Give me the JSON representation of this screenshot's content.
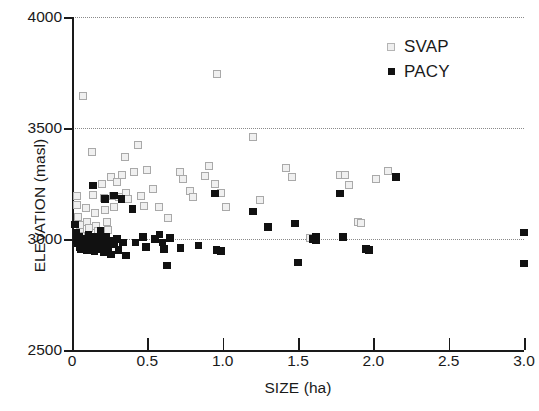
{
  "chart_data": {
    "type": "scatter",
    "title": "",
    "xlabel": "SIZE (ha)",
    "ylabel": "ELEVATION (masl)",
    "xlim": [
      0,
      3.0
    ],
    "ylim": [
      2500,
      4000
    ],
    "xticks": [
      "0",
      "0.5",
      "1.0",
      "1.5",
      "2.0",
      "2.5",
      "3.0"
    ],
    "xtick_values": [
      0,
      0.5,
      1.0,
      1.5,
      2.0,
      2.5,
      3.0
    ],
    "yticks": [
      "2500",
      "3000",
      "3500",
      "4000"
    ],
    "ytick_values": [
      2500,
      3000,
      3500,
      4000
    ],
    "grid": "horizontal-dotted",
    "gridline_values": [
      3000,
      3500,
      4000
    ],
    "legend_position": "top-right",
    "legend": [
      {
        "label": "SVAP",
        "marker": "open-square",
        "color": "#a9a9a9",
        "fill": "#f0f0f0"
      },
      {
        "label": "PACY",
        "marker": "filled-square",
        "color": "#111111",
        "fill": "#111111"
      }
    ],
    "series": [
      {
        "name": "SVAP",
        "marker": "open-square",
        "color": "#a9a9a9",
        "points": [
          [
            0.07,
            3645
          ],
          [
            0.96,
            3745
          ],
          [
            0.03,
            3195
          ],
          [
            0.03,
            3155
          ],
          [
            0.04,
            3100
          ],
          [
            0.05,
            3065
          ],
          [
            0.05,
            3030
          ],
          [
            0.06,
            3015
          ],
          [
            0.07,
            2995
          ],
          [
            0.09,
            3140
          ],
          [
            0.1,
            3075
          ],
          [
            0.11,
            3050
          ],
          [
            0.12,
            3010
          ],
          [
            0.13,
            3390
          ],
          [
            0.14,
            3200
          ],
          [
            0.15,
            3115
          ],
          [
            0.16,
            3060
          ],
          [
            0.17,
            3035
          ],
          [
            0.18,
            3005
          ],
          [
            0.2,
            3250
          ],
          [
            0.21,
            3185
          ],
          [
            0.22,
            3130
          ],
          [
            0.23,
            3075
          ],
          [
            0.24,
            3040
          ],
          [
            0.26,
            3280
          ],
          [
            0.27,
            3195
          ],
          [
            0.28,
            3145
          ],
          [
            0.3,
            3255
          ],
          [
            0.31,
            3190
          ],
          [
            0.33,
            3290
          ],
          [
            0.35,
            3370
          ],
          [
            0.36,
            3205
          ],
          [
            0.37,
            3180
          ],
          [
            0.41,
            3300
          ],
          [
            0.44,
            3425
          ],
          [
            0.46,
            3195
          ],
          [
            0.48,
            3150
          ],
          [
            0.5,
            3310
          ],
          [
            0.54,
            3225
          ],
          [
            0.58,
            3145
          ],
          [
            0.64,
            3095
          ],
          [
            0.72,
            3300
          ],
          [
            0.74,
            3270
          ],
          [
            0.78,
            3215
          ],
          [
            0.8,
            3190
          ],
          [
            0.88,
            3285
          ],
          [
            0.91,
            3330
          ],
          [
            0.95,
            3250
          ],
          [
            0.99,
            3205
          ],
          [
            1.02,
            3145
          ],
          [
            1.2,
            3460
          ],
          [
            1.25,
            3175
          ],
          [
            1.42,
            3320
          ],
          [
            1.46,
            3280
          ],
          [
            1.58,
            3005
          ],
          [
            1.78,
            3290
          ],
          [
            1.81,
            3290
          ],
          [
            1.84,
            3245
          ],
          [
            1.9,
            3075
          ],
          [
            1.92,
            3070
          ],
          [
            2.02,
            3270
          ],
          [
            2.1,
            3305
          ]
        ]
      },
      {
        "name": "PACY",
        "marker": "filled-square",
        "color": "#111111",
        "points": [
          [
            0.02,
            3065
          ],
          [
            0.03,
            3030
          ],
          [
            0.03,
            2995
          ],
          [
            0.04,
            2980
          ],
          [
            0.05,
            3010
          ],
          [
            0.05,
            2965
          ],
          [
            0.06,
            2990
          ],
          [
            0.06,
            2955
          ],
          [
            0.07,
            2975
          ],
          [
            0.08,
            3000
          ],
          [
            0.08,
            2960
          ],
          [
            0.09,
            2985
          ],
          [
            0.1,
            2950
          ],
          [
            0.11,
            3020
          ],
          [
            0.11,
            2975
          ],
          [
            0.12,
            2995
          ],
          [
            0.13,
            2960
          ],
          [
            0.14,
            3240
          ],
          [
            0.14,
            2985
          ],
          [
            0.15,
            3010
          ],
          [
            0.15,
            2945
          ],
          [
            0.16,
            2975
          ],
          [
            0.17,
            3000
          ],
          [
            0.17,
            2955
          ],
          [
            0.18,
            2985
          ],
          [
            0.19,
            3035
          ],
          [
            0.19,
            2965
          ],
          [
            0.2,
            3000
          ],
          [
            0.21,
            2940
          ],
          [
            0.22,
            3180
          ],
          [
            0.22,
            2980
          ],
          [
            0.23,
            3010
          ],
          [
            0.24,
            2955
          ],
          [
            0.25,
            2990
          ],
          [
            0.26,
            2930
          ],
          [
            0.28,
            3195
          ],
          [
            0.28,
            2975
          ],
          [
            0.3,
            3000
          ],
          [
            0.31,
            2950
          ],
          [
            0.33,
            3180
          ],
          [
            0.34,
            2985
          ],
          [
            0.36,
            2925
          ],
          [
            0.4,
            3135
          ],
          [
            0.42,
            2985
          ],
          [
            0.47,
            3010
          ],
          [
            0.49,
            2965
          ],
          [
            0.55,
            3000
          ],
          [
            0.58,
            3020
          ],
          [
            0.6,
            2985
          ],
          [
            0.61,
            2955
          ],
          [
            0.63,
            2880
          ],
          [
            0.65,
            3005
          ],
          [
            0.72,
            2960
          ],
          [
            0.84,
            2970
          ],
          [
            0.95,
            3205
          ],
          [
            0.96,
            2950
          ],
          [
            0.99,
            2945
          ],
          [
            1.2,
            3125
          ],
          [
            1.3,
            3055
          ],
          [
            1.48,
            3070
          ],
          [
            1.5,
            2895
          ],
          [
            1.6,
            3000
          ],
          [
            1.62,
            3010
          ],
          [
            1.62,
            2995
          ],
          [
            1.78,
            3205
          ],
          [
            1.8,
            3010
          ],
          [
            1.95,
            2955
          ],
          [
            1.97,
            2950
          ],
          [
            2.15,
            3280
          ],
          [
            3.0,
            3030
          ],
          [
            3.0,
            2890
          ]
        ]
      }
    ]
  },
  "plot_geometry": {
    "left_px": 72,
    "right_px": 524,
    "top_px": 17,
    "bottom_px": 350
  }
}
